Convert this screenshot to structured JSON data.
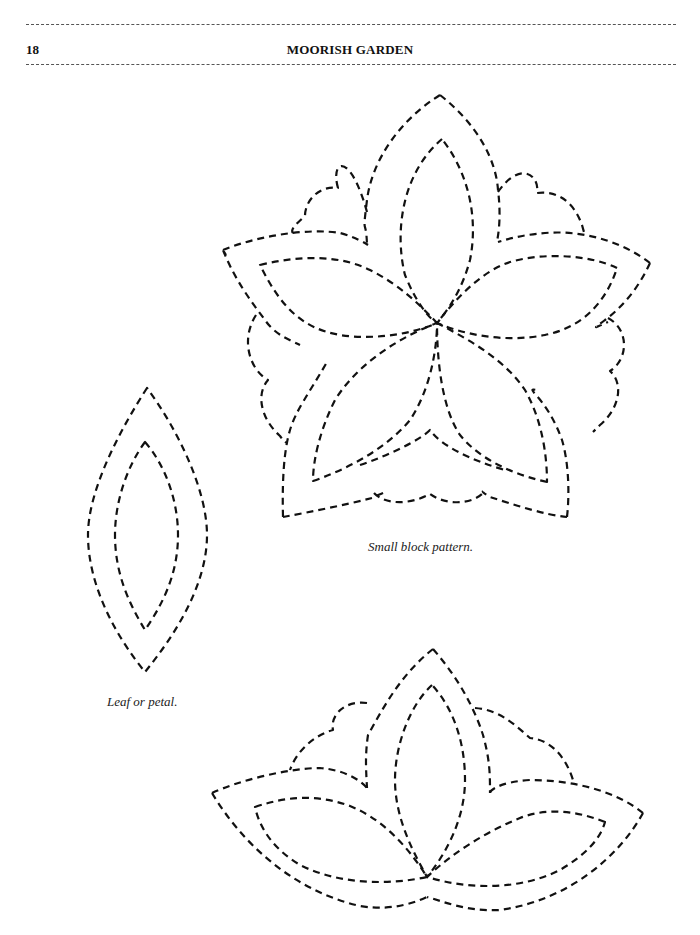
{
  "header": {
    "page_number": "18",
    "running_title": "MOORISH GARDEN"
  },
  "figures": [
    {
      "id": "small-block-pattern",
      "caption": "Small block pattern."
    },
    {
      "id": "leaf-or-petal",
      "caption": "Leaf or petal."
    },
    {
      "id": "lotus-pattern",
      "caption": ""
    }
  ],
  "style": {
    "line_color": "#111111",
    "rule_color": "#555555",
    "background": "#ffffff"
  }
}
